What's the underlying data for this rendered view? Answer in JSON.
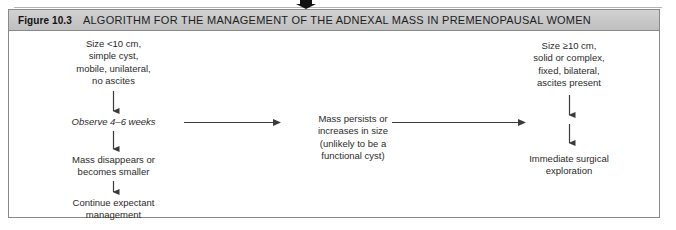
{
  "figure": {
    "number": "Figure 10.3",
    "caption": "ALGORITHM FOR THE MANAGEMENT OF THE ADNEXAL MASS IN PREMENOPAUSAL WOMEN"
  },
  "diagram": {
    "type": "flowchart",
    "nodes": [
      {
        "id": "criteria-benign",
        "text": "Size <10 cm,\nsimple cyst,\nmobile, unilateral,\nno ascites",
        "style": "plain",
        "branch": "left"
      },
      {
        "id": "observe",
        "text": "Observe 4–6 weeks",
        "style": "italic",
        "branch": "left"
      },
      {
        "id": "mass-resolves",
        "text": "Mass disappears or\nbecomes smaller",
        "style": "plain",
        "branch": "left"
      },
      {
        "id": "continue-expectant",
        "text": "Continue expectant\nmanagement",
        "style": "plain",
        "branch": "left"
      },
      {
        "id": "mass-persists",
        "text": "Mass persists or\nincreases in size\n(unlikely to be a\nfunctional cyst)",
        "style": "plain",
        "branch": "center"
      },
      {
        "id": "criteria-malignant",
        "text": "Size ≥10 cm,\nsolid or complex,\nfixed, bilateral,\nascites present",
        "style": "plain",
        "branch": "right"
      },
      {
        "id": "immediate-surgery",
        "text": "Immediate surgical\nexploration",
        "style": "plain",
        "branch": "right"
      }
    ],
    "edges": [
      {
        "id": "criteria-benign-to-observe",
        "from": "criteria-benign",
        "to": "observe",
        "direction": "down"
      },
      {
        "id": "observe-to-mass-resolves",
        "from": "observe",
        "to": "mass-resolves",
        "direction": "down"
      },
      {
        "id": "mass-resolves-to-expectant",
        "from": "mass-resolves",
        "to": "continue-expectant",
        "direction": "down"
      },
      {
        "id": "observe-to-mass-persists",
        "from": "observe",
        "to": "mass-persists",
        "direction": "right"
      },
      {
        "id": "mass-persists-to-surgery",
        "from": "mass-persists",
        "to": "immediate-surgery",
        "direction": "right"
      },
      {
        "id": "criteria-malignant-to-surgery",
        "from": "criteria-malignant",
        "to": "immediate-surgery",
        "direction": "down"
      }
    ]
  },
  "colors": {
    "frame_border": "#8a8a8a",
    "title_bar": "#c9c9c9",
    "text": "#2b2b2b",
    "connector": "#3a3a3a",
    "background": "#ffffff"
  }
}
